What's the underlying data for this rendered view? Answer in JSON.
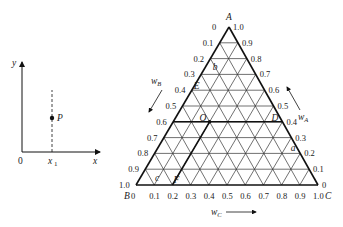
{
  "left_plot": {
    "y_axis_label": "y",
    "x_axis_label": "x",
    "origin_label": "0",
    "x1_label": "x",
    "x1_subscript": "1",
    "point_label": "P"
  },
  "ternary": {
    "vertex_a": "A",
    "vertex_b": "B",
    "vertex_c": "C",
    "axis_wa": "w",
    "axis_wa_sub": "A",
    "axis_wb": "w",
    "axis_wb_sub": "B",
    "axis_wc": "w",
    "axis_wc_sub": "C",
    "left_ticks": [
      "0",
      "0.1",
      "0.2",
      "0.3",
      "0.4",
      "0.5",
      "0.6",
      "0.7",
      "0.8",
      "0.9",
      "1.0"
    ],
    "right_ticks": [
      "1.0",
      "0.9",
      "0.8",
      "0.7",
      "0.6",
      "0.5",
      "0.4",
      "0.3",
      "0.2",
      "0.1",
      "0"
    ],
    "bottom_ticks": [
      "0",
      "0.1",
      "0.2",
      "0.3",
      "0.4",
      "0.5",
      "0.6",
      "0.7",
      "0.8",
      "0.9",
      "1.0"
    ],
    "points": {
      "O": "O",
      "D": "D",
      "E": "E",
      "F": "F",
      "a": "a",
      "b": "b",
      "c": "c"
    }
  }
}
